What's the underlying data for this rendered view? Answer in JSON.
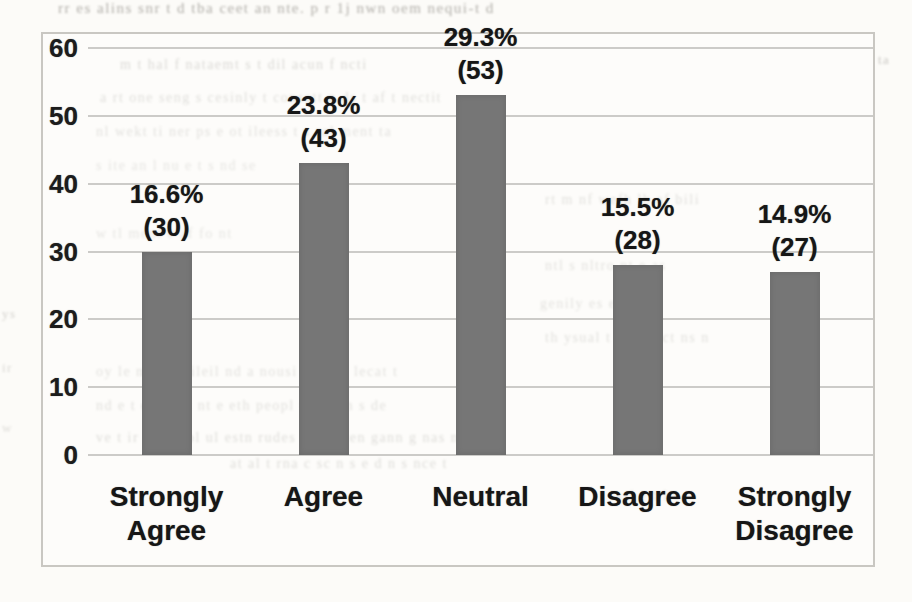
{
  "page": {
    "kind": "scanned document page containing a survey results bar chart",
    "background_color": "#fcfbf8"
  },
  "chart": {
    "frame_border_color": "#c9c7c2",
    "bar_color": "#767676",
    "gridline_color": "#c3c2be",
    "text_color": "#1c1c1c"
  },
  "chart_data": {
    "type": "bar",
    "categories": [
      "Strongly Agree",
      "Agree",
      "Neutral",
      "Disagree",
      "Strongly Disagree"
    ],
    "values": [
      30,
      43,
      53,
      28,
      27
    ],
    "percent_labels": [
      "16.6%",
      "23.8%",
      "29.3%",
      "15.5%",
      "14.9%"
    ],
    "count_labels": [
      "(30)",
      "(43)",
      "(53)",
      "(28)",
      "(27)"
    ],
    "title": "",
    "xlabel": "",
    "ylabel": "",
    "ylim": [
      0,
      60
    ],
    "yticks": [
      "0",
      "10",
      "20",
      "30",
      "40",
      "50",
      "60"
    ],
    "grid": true,
    "legend_position": "none",
    "bar_fill": "#767676"
  },
  "scan_noise": {
    "color": "#97948e",
    "lines": [
      {
        "x": 58,
        "y": 0,
        "s": 15,
        "o": 0.75,
        "t": "rr es alins snr t d tba ceet an      nte. p r 1j nwn oem nequi-t d"
      },
      {
        "x": 120,
        "y": 57,
        "s": 14,
        "o": 0.45,
        "t": "m   t hal f      nataemt   s t dil acun    f ncti"
      },
      {
        "x": 878,
        "y": 52,
        "s": 13,
        "o": 0.5,
        "t": "ta"
      },
      {
        "x": 100,
        "y": 90,
        "s": 14,
        "o": 0.38,
        "t": "a rt one seng s cesinly t consatt n ds t af t nectit"
      },
      {
        "x": 96,
        "y": 124,
        "s": 14,
        "o": 0.35,
        "t": "nl wekt ti ner ps e ot ileess    t s ral ment ta"
      },
      {
        "x": 96,
        "y": 158,
        "s": 14,
        "o": 0.3,
        "t": "s ite an   l nu e t s    nd se"
      },
      {
        "x": 545,
        "y": 192,
        "s": 14,
        "o": 0.36,
        "t": "rt m nf wefh lb af bili"
      },
      {
        "x": 96,
        "y": 226,
        "s": 14,
        "o": 0.3,
        "t": "w tl ment e af fo   nt"
      },
      {
        "x": 545,
        "y": 258,
        "s": 14,
        "o": 0.34,
        "t": "ntl s nltro nt   e as"
      },
      {
        "x": 2,
        "y": 306,
        "s": 13,
        "o": 0.4,
        "t": "ys"
      },
      {
        "x": 540,
        "y": 296,
        "s": 14,
        "o": 0.34,
        "t": "genily es e pesce"
      },
      {
        "x": 545,
        "y": 330,
        "s": 14,
        "o": 0.36,
        "t": "th ysual t r af nect ns n"
      },
      {
        "x": 2,
        "y": 360,
        "s": 13,
        "o": 0.35,
        "t": "ir"
      },
      {
        "x": 96,
        "y": 364,
        "s": 14,
        "o": 0.35,
        "t": "oy le n otse cileil nd a nousi val r o lecat  t"
      },
      {
        "x": 96,
        "y": 398,
        "s": 14,
        "o": 0.36,
        "t": "nd e t e lur ot nt e eth peopl n h er n s de"
      },
      {
        "x": 2,
        "y": 420,
        "s": 13,
        "o": 0.3,
        "t": "w"
      },
      {
        "x": 96,
        "y": 430,
        "s": 14,
        "o": 0.4,
        "t": "ve t ir n ot t ol ul estn rudes and cr en gann g  nas  na"
      },
      {
        "x": 230,
        "y": 456,
        "s": 14,
        "o": 0.4,
        "t": "at al t rna c sc n s e d  n s nce  t"
      },
      {
        "x": 615,
        "y": 488,
        "s": 14,
        "o": 0.33,
        "t": "asi e t  l s"
      }
    ]
  }
}
